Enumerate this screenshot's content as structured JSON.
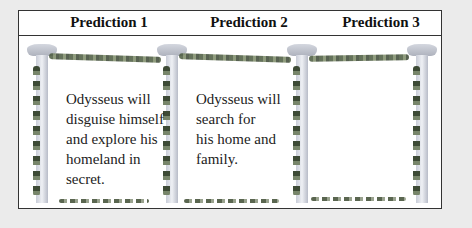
{
  "header": {
    "columns": [
      {
        "label": "Prediction 1"
      },
      {
        "label": "Prediction 2"
      },
      {
        "label": "Prediction 3"
      }
    ]
  },
  "predictions": [
    {
      "lines": [
        "Odysseus will",
        "disguise himself",
        "and explore his",
        "homeland in",
        "secret."
      ]
    },
    {
      "lines": [
        "Odysseus will",
        "search for",
        "his home and",
        "family."
      ]
    },
    {
      "lines": []
    }
  ],
  "decoration": {
    "pillar_color": "#c9cdd8",
    "garland_color": "#4a5a3e",
    "border_color": "#333333",
    "background": "#ebebeb"
  }
}
